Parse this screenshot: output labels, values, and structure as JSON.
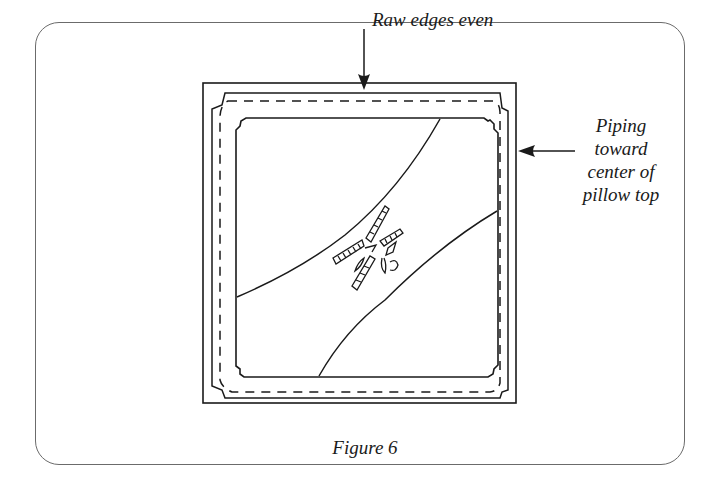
{
  "figure": {
    "caption": "Figure 6",
    "annotations": {
      "top": "Raw edges even",
      "right": {
        "lines": [
          "Piping",
          "toward",
          "center of",
          "pillow top"
        ]
      }
    },
    "elements": {
      "outer_square": "pillow back edge",
      "inner_stitched_square": "pillow top with piping",
      "dashed_line": "stitching line",
      "center_motif": "decorative appliqué design"
    },
    "colors": {
      "ink": "#1a1a1a",
      "frame": "#6b6b6b",
      "background": "#ffffff"
    }
  }
}
